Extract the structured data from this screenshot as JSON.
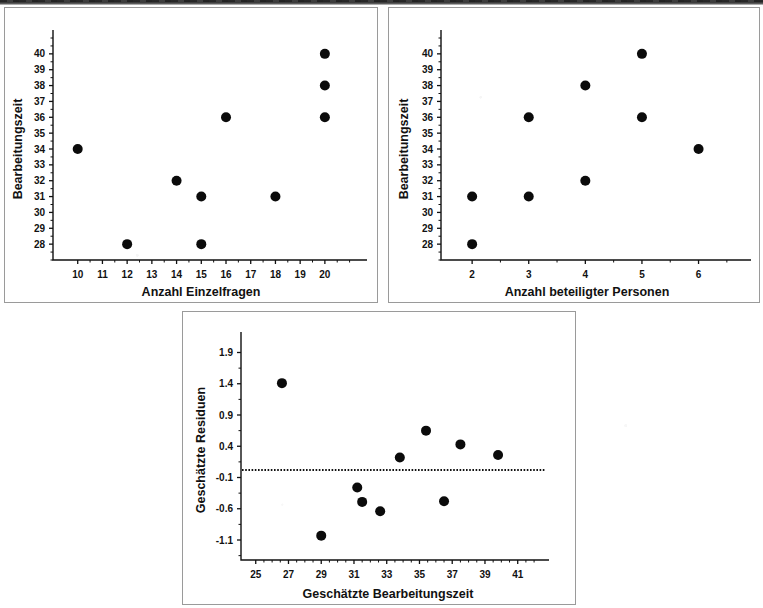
{
  "figure": {
    "background_color": "#ffffff",
    "ink_color": "#111111",
    "panel_border_color": "#9a9a9a",
    "scan_band": {
      "name": "scan-artifact-band",
      "color": "#1e1e1e"
    }
  },
  "chart_data": [
    {
      "panel": 1,
      "type": "scatter",
      "title": "",
      "xlabel": "Anzahl Einzelfragen",
      "ylabel": "Bearbeitungszeit",
      "xlim": [
        9.0,
        21.3
      ],
      "ylim": [
        27.0,
        41.0
      ],
      "xticks": [
        10,
        11,
        12,
        13,
        14,
        15,
        16,
        17,
        18,
        19,
        20
      ],
      "xtick_labels": [
        "10",
        "11",
        "12",
        "13",
        "14",
        "15",
        "16",
        "17",
        "18",
        "19",
        "20"
      ],
      "yticks": [
        28,
        29,
        30,
        31,
        32,
        33,
        34,
        35,
        36,
        37,
        38,
        39,
        40
      ],
      "ytick_labels": [
        "28",
        "29",
        "30",
        "31",
        "32",
        "33",
        "34",
        "35",
        "36",
        "37",
        "38",
        "39",
        "40"
      ],
      "grid": false,
      "legend": false,
      "x": [
        10,
        12,
        14,
        15,
        15,
        16,
        18,
        20,
        20,
        20
      ],
      "y": [
        34,
        28,
        32,
        31,
        28,
        36,
        31,
        40,
        38,
        36
      ]
    },
    {
      "panel": 2,
      "type": "scatter",
      "title": "",
      "xlabel": "Anzahl beteiligter Personen",
      "ylabel": "Bearbeitungszeit",
      "xlim": [
        1.45,
        6.75
      ],
      "ylim": [
        27.0,
        41.0
      ],
      "xticks": [
        2,
        3,
        4,
        5,
        6
      ],
      "xtick_labels": [
        "2",
        "3",
        "4",
        "5",
        "6"
      ],
      "yticks": [
        28,
        29,
        30,
        31,
        32,
        33,
        34,
        35,
        36,
        37,
        38,
        39,
        40
      ],
      "ytick_labels": [
        "28",
        "29",
        "30",
        "31",
        "32",
        "33",
        "34",
        "35",
        "36",
        "37",
        "38",
        "39",
        "40"
      ],
      "grid": false,
      "legend": false,
      "x": [
        2,
        2,
        3,
        3,
        4,
        4,
        5,
        5,
        6
      ],
      "y": [
        31,
        28,
        36,
        31,
        38,
        32,
        40,
        36,
        34
      ]
    },
    {
      "panel": 3,
      "type": "scatter",
      "title": "",
      "xlabel": "Geschätzte Bearbeitungszeit",
      "ylabel": "Geschätzte Residuen",
      "xlim": [
        24.1,
        42.3
      ],
      "ylim": [
        -1.42,
        2.1
      ],
      "xticks": [
        25,
        27,
        29,
        31,
        33,
        35,
        37,
        39,
        41
      ],
      "xtick_labels": [
        "25",
        "27",
        "29",
        "31",
        "33",
        "35",
        "37",
        "39",
        "41"
      ],
      "yticks": [
        -1.1,
        -0.6,
        -0.1,
        0.4,
        0.9,
        1.4,
        1.9
      ],
      "ytick_labels": [
        "-1.1",
        "-0.6",
        "-0.1",
        "0.4",
        "0.9",
        "1.4",
        "1.9"
      ],
      "grid": false,
      "legend": false,
      "x": [
        26.6,
        29.0,
        31.2,
        31.5,
        32.6,
        33.8,
        35.4,
        36.5,
        37.5,
        39.8
      ],
      "y": [
        1.41,
        -1.03,
        -0.26,
        -0.49,
        -0.64,
        0.22,
        0.65,
        -0.48,
        0.43,
        0.26
      ],
      "reference_line": {
        "name": "zero-residual-line",
        "y": 0.02,
        "style": "dotted"
      }
    }
  ]
}
